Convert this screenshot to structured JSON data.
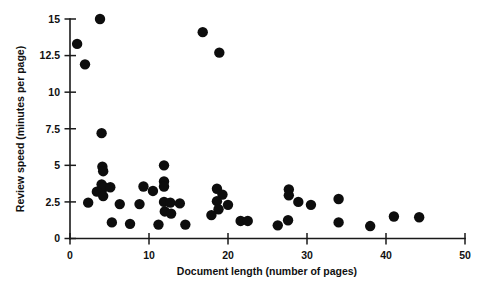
{
  "chart_data": {
    "type": "scatter",
    "title": "",
    "xlabel": "Document length (number of pages)",
    "ylabel": "Review speed (minutes per page)",
    "xlim": [
      0,
      50
    ],
    "ylim": [
      0,
      15
    ],
    "xticks": [
      0,
      10,
      20,
      30,
      40,
      50
    ],
    "yticks": [
      0,
      2.5,
      5,
      7.5,
      10,
      12.5,
      15
    ],
    "xtick_labels": [
      "0",
      "10",
      "20",
      "30",
      "40",
      "50"
    ],
    "ytick_labels": [
      "0",
      "2.5",
      "5",
      "7.5",
      "10",
      "12.5",
      "15"
    ],
    "grid": false,
    "legend": false,
    "marker": "filled-circle",
    "marker_color": "#0d0d0d",
    "marker_size": 5.2,
    "points": [
      [
        0.9,
        13.3
      ],
      [
        1.9,
        11.9
      ],
      [
        3.8,
        15.0
      ],
      [
        4.0,
        7.2
      ],
      [
        4.1,
        4.9
      ],
      [
        4.2,
        4.6
      ],
      [
        4.0,
        3.7
      ],
      [
        4.3,
        3.5
      ],
      [
        3.4,
        3.2
      ],
      [
        4.2,
        2.9
      ],
      [
        5.1,
        3.5
      ],
      [
        2.3,
        2.45
      ],
      [
        5.3,
        1.1
      ],
      [
        6.3,
        2.35
      ],
      [
        7.6,
        1.0
      ],
      [
        8.8,
        2.35
      ],
      [
        9.3,
        3.55
      ],
      [
        10.5,
        3.25
      ],
      [
        11.2,
        0.95
      ],
      [
        11.9,
        5.0
      ],
      [
        11.9,
        3.9
      ],
      [
        11.9,
        3.55
      ],
      [
        11.9,
        2.5
      ],
      [
        12.7,
        2.45
      ],
      [
        12.0,
        1.85
      ],
      [
        12.8,
        1.7
      ],
      [
        13.9,
        2.4
      ],
      [
        14.6,
        0.95
      ],
      [
        16.8,
        14.1
      ],
      [
        18.9,
        12.7
      ],
      [
        18.6,
        3.4
      ],
      [
        19.3,
        3.0
      ],
      [
        18.6,
        2.55
      ],
      [
        20.0,
        2.3
      ],
      [
        18.8,
        2.0
      ],
      [
        17.9,
        1.6
      ],
      [
        21.6,
        1.2
      ],
      [
        22.5,
        1.2
      ],
      [
        26.3,
        0.9
      ],
      [
        27.7,
        3.35
      ],
      [
        27.7,
        2.95
      ],
      [
        27.6,
        1.25
      ],
      [
        28.9,
        2.5
      ],
      [
        30.5,
        2.3
      ],
      [
        34.0,
        2.7
      ],
      [
        34.0,
        1.1
      ],
      [
        38.0,
        0.85
      ],
      [
        41.0,
        1.5
      ],
      [
        44.2,
        1.45
      ]
    ]
  }
}
